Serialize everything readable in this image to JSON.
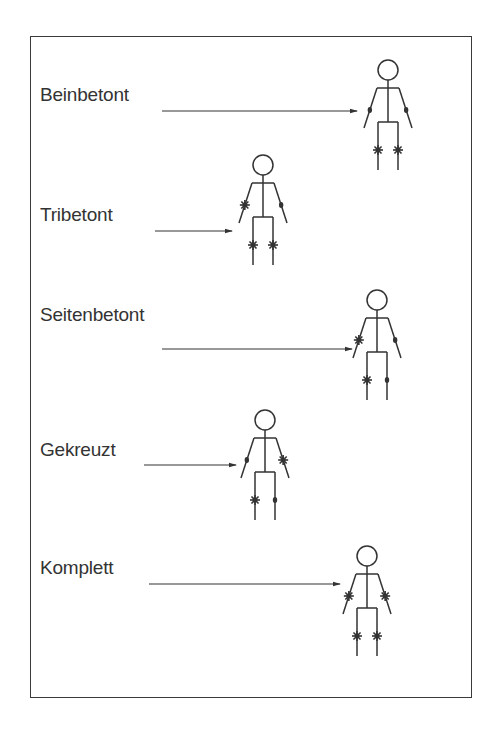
{
  "diagram": {
    "type": "stick-figure-joint-pattern-legend",
    "legend_symbols": {
      "star": "affected joint (asterisk)",
      "dot": "unaffected / mildly marked joint (dot)"
    },
    "colors": {
      "ink": "#333333",
      "frame": "#3a3a3a",
      "background": "#ffffff"
    },
    "rows": [
      {
        "label": "Beinbetont",
        "label_pos": [
          40,
          97
        ],
        "arrow": {
          "x1": 162,
          "y1": 111,
          "x2": 357,
          "y2": 111
        },
        "figure": {
          "cx": 388,
          "headY": 70
        },
        "joints": {
          "left_elbow": "dot",
          "right_elbow": "dot",
          "left_knee": "star",
          "right_knee": "star"
        }
      },
      {
        "label": "Tribetont",
        "label_pos": [
          40,
          217
        ],
        "arrow": {
          "x1": 155,
          "y1": 231,
          "x2": 232,
          "y2": 231
        },
        "figure": {
          "cx": 263,
          "headY": 165
        },
        "joints": {
          "left_elbow": "star",
          "right_elbow": "dot",
          "left_knee": "star",
          "right_knee": "star"
        }
      },
      {
        "label": "Seitenbetont",
        "label_pos": [
          40,
          317
        ],
        "arrow": {
          "x1": 162,
          "y1": 349,
          "x2": 352,
          "y2": 349
        },
        "figure": {
          "cx": 377,
          "headY": 300
        },
        "joints": {
          "left_elbow": "star",
          "right_elbow": "dot",
          "left_knee": "star",
          "right_knee": "dot"
        }
      },
      {
        "label": "Gekreuzt",
        "label_pos": [
          40,
          452
        ],
        "arrow": {
          "x1": 144,
          "y1": 465,
          "x2": 236,
          "y2": 465
        },
        "figure": {
          "cx": 265,
          "headY": 420
        },
        "joints": {
          "left_elbow": "dot",
          "right_elbow": "star",
          "left_knee": "star",
          "right_knee": "dot"
        }
      },
      {
        "label": "Komplett",
        "label_pos": [
          40,
          570
        ],
        "arrow": {
          "x1": 149,
          "y1": 584,
          "x2": 340,
          "y2": 584
        },
        "figure": {
          "cx": 367,
          "headY": 556
        },
        "joints": {
          "left_elbow": "star",
          "right_elbow": "star",
          "left_knee": "star",
          "right_knee": "star"
        }
      }
    ]
  }
}
